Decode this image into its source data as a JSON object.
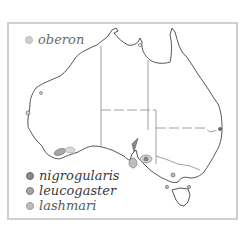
{
  "map": {
    "region": "Australia",
    "species": [
      {
        "name": "oberon",
        "color": "#cfcfcf",
        "position": "top-left"
      },
      {
        "name": "nigrogularis",
        "color": "#8a8a8a",
        "position": "bottom-left"
      },
      {
        "name": "leucogaster",
        "color": "#a6a6a6",
        "position": "bottom-left"
      },
      {
        "name": "lashmari",
        "color": "#bdbdbd",
        "position": "bottom-left"
      }
    ],
    "colors": {
      "frame": "#cfcfcf",
      "coast": "#555555",
      "state_border": "#888888"
    }
  }
}
